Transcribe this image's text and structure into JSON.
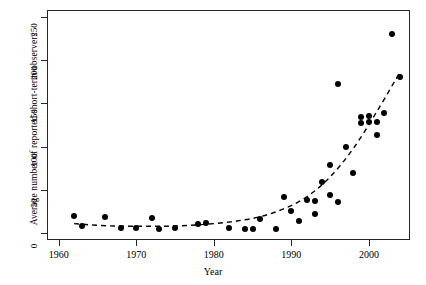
{
  "chart_data": {
    "type": "scatter",
    "title": "",
    "xlabel": "Year",
    "ylabel": "Average number of  reported short-term observers",
    "xlim": [
      1958.5,
      2005.3
    ],
    "ylim": [
      -8,
      258
    ],
    "xticks": [
      1960,
      1970,
      1980,
      1990,
      2000
    ],
    "xticklabels": [
      "1960",
      "1970",
      "1980",
      "1990",
      "2000"
    ],
    "yticks": [
      0,
      50,
      100,
      150,
      200,
      250
    ],
    "yticklabels": [
      "0",
      "50",
      "100",
      "150",
      "200",
      "250"
    ],
    "grid": false,
    "legend": null,
    "marker": "filled-circle",
    "marker_color": "#000000",
    "points": [
      {
        "x": 1962,
        "y": 20
      },
      {
        "x": 1963,
        "y": 8
      },
      {
        "x": 1966,
        "y": 19
      },
      {
        "x": 1968,
        "y": 6
      },
      {
        "x": 1970,
        "y": 6
      },
      {
        "x": 1972,
        "y": 17
      },
      {
        "x": 1973,
        "y": 5
      },
      {
        "x": 1975,
        "y": 6
      },
      {
        "x": 1978,
        "y": 11
      },
      {
        "x": 1979,
        "y": 12
      },
      {
        "x": 1982,
        "y": 6
      },
      {
        "x": 1984,
        "y": 5
      },
      {
        "x": 1985,
        "y": 5
      },
      {
        "x": 1986,
        "y": 16
      },
      {
        "x": 1988,
        "y": 5
      },
      {
        "x": 1989,
        "y": 42
      },
      {
        "x": 1990,
        "y": 25
      },
      {
        "x": 1991,
        "y": 14
      },
      {
        "x": 1992,
        "y": 38
      },
      {
        "x": 1993,
        "y": 37
      },
      {
        "x": 1993,
        "y": 22
      },
      {
        "x": 1994,
        "y": 59
      },
      {
        "x": 1995,
        "y": 44
      },
      {
        "x": 1995,
        "y": 79
      },
      {
        "x": 1996,
        "y": 36
      },
      {
        "x": 1996,
        "y": 172
      },
      {
        "x": 1997,
        "y": 100
      },
      {
        "x": 1998,
        "y": 69
      },
      {
        "x": 1999,
        "y": 127
      },
      {
        "x": 1999,
        "y": 134
      },
      {
        "x": 2000,
        "y": 135
      },
      {
        "x": 2000,
        "y": 128
      },
      {
        "x": 2001,
        "y": 113
      },
      {
        "x": 2001,
        "y": 129
      },
      {
        "x": 2002,
        "y": 139
      },
      {
        "x": 2003,
        "y": 230
      },
      {
        "x": 2004,
        "y": 180
      }
    ],
    "trend": {
      "style": "dashed",
      "color": "#000000",
      "description": "fitted exponential-like smooth curve",
      "points": [
        {
          "x": 1962,
          "y": 11
        },
        {
          "x": 1965,
          "y": 9
        },
        {
          "x": 1968,
          "y": 8
        },
        {
          "x": 1971,
          "y": 8
        },
        {
          "x": 1974,
          "y": 8
        },
        {
          "x": 1977,
          "y": 9
        },
        {
          "x": 1980,
          "y": 11
        },
        {
          "x": 1983,
          "y": 14
        },
        {
          "x": 1986,
          "y": 19
        },
        {
          "x": 1989,
          "y": 28
        },
        {
          "x": 1992,
          "y": 42
        },
        {
          "x": 1995,
          "y": 65
        },
        {
          "x": 1998,
          "y": 98
        },
        {
          "x": 2001,
          "y": 140
        },
        {
          "x": 2004,
          "y": 186
        }
      ]
    }
  }
}
